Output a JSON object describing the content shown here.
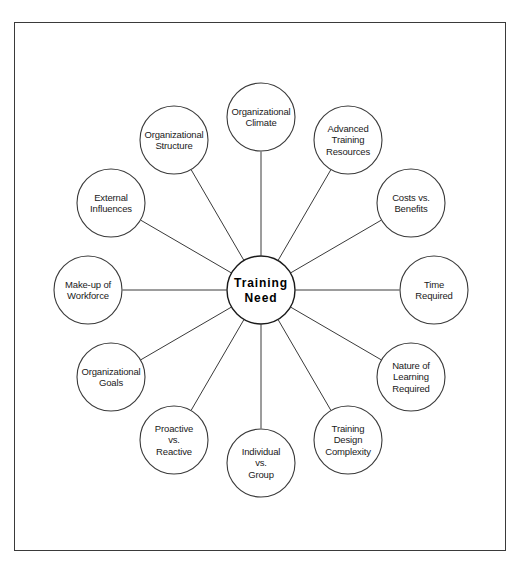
{
  "diagram": {
    "center": {
      "label": "Training Need",
      "lines": [
        "Training",
        "Need"
      ],
      "cx": 261,
      "cy": 290,
      "r": 34
    },
    "style": {
      "stroke": "#3a3a3a",
      "center_stroke": "#1a1a1a",
      "background": "#ffffff",
      "text_color": "#1a1a1a",
      "orbit_radius": 173,
      "node_radius": 34
    },
    "frame": {
      "x": 14,
      "y": 22,
      "width": 492,
      "height": 529
    },
    "nodes": [
      {
        "id": "organizational-climate",
        "label": "Organizational Climate",
        "lines": [
          "Organizational",
          "Climate"
        ],
        "angle": -90,
        "cx": 261,
        "cy": 117
      },
      {
        "id": "advanced-training-resources",
        "label": "Advanced Training Resources",
        "lines": [
          "Advanced",
          "Training",
          "Resources"
        ],
        "angle": -60,
        "cx": 348,
        "cy": 140
      },
      {
        "id": "costs-vs-benefits",
        "label": "Costs vs. Benefits",
        "lines": [
          "Costs vs.",
          "Benefits"
        ],
        "angle": -30,
        "cx": 411,
        "cy": 203
      },
      {
        "id": "time-required",
        "label": "Time Required",
        "lines": [
          "Time",
          "Required"
        ],
        "angle": 0,
        "cx": 434,
        "cy": 290
      },
      {
        "id": "nature-of-learning-required",
        "label": "Nature of Learning Required",
        "lines": [
          "Nature of",
          "Learning",
          "Required"
        ],
        "angle": 30,
        "cx": 411,
        "cy": 377
      },
      {
        "id": "training-design-complexity",
        "label": "Training Design Complexity",
        "lines": [
          "Training",
          "Design",
          "Complexity"
        ],
        "angle": 60,
        "cx": 348,
        "cy": 440
      },
      {
        "id": "individual-vs-group",
        "label": "Individual vs. Group",
        "lines": [
          "Individual",
          "vs.",
          "Group"
        ],
        "angle": 90,
        "cx": 261,
        "cy": 463
      },
      {
        "id": "proactive-vs-reactive",
        "label": "Proactive vs. Reactive",
        "lines": [
          "Proactive",
          "vs.",
          "Reactive"
        ],
        "angle": 120,
        "cx": 174,
        "cy": 440
      },
      {
        "id": "organizational-goals",
        "label": "Organizational Goals",
        "lines": [
          "Organizational",
          "Goals"
        ],
        "angle": 150,
        "cx": 111,
        "cy": 377
      },
      {
        "id": "make-up-of-workforce",
        "label": "Make-up of Workforce",
        "lines": [
          "Make-up of",
          "Workforce"
        ],
        "angle": 180,
        "cx": 88,
        "cy": 290
      },
      {
        "id": "external-influences",
        "label": "External Influences",
        "lines": [
          "External",
          "Influences"
        ],
        "angle": 210,
        "cx": 111,
        "cy": 203
      },
      {
        "id": "organizational-structure",
        "label": "Organizational Structure",
        "lines": [
          "Organizational",
          "Structure"
        ],
        "angle": 240,
        "cx": 174,
        "cy": 140
      }
    ]
  }
}
